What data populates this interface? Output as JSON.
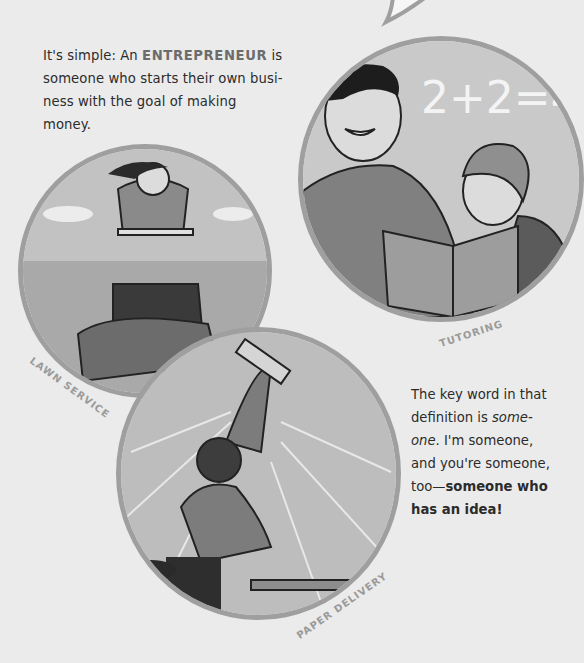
{
  "intro": {
    "before": "It's simple: An ",
    "highlight": "ENTREPRENEUR",
    "after": " is someone who starts their own busi-ness with the goal of making money."
  },
  "illustrations": [
    {
      "id": "tutoring",
      "label": "TUTORING",
      "board_text": "2+2=4"
    },
    {
      "id": "lawn",
      "label": "LAWN SERVICE"
    },
    {
      "id": "paper",
      "label": "PAPER DELIVERY"
    }
  ],
  "outro": {
    "part1": "The key word in that definition is ",
    "italic": "some-one",
    "part2": ". I'm someone, and you're someone, too—",
    "bold": "someone who has an idea!"
  },
  "colors": {
    "background": "#ebebeb",
    "ring": "#9f9f9f",
    "label": "#9a9a9a",
    "highlight": "#6c6c6c"
  }
}
